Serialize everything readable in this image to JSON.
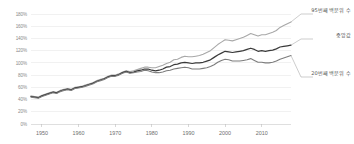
{
  "chart_data": {
    "type": "line",
    "title": "",
    "subtitle": "",
    "xlabel": "",
    "ylabel": "",
    "xlim": [
      1947,
      2018
    ],
    "ylim": [
      0,
      180
    ],
    "grid": true,
    "legend_position": "inline-right-annotations",
    "y_ticks": [
      0,
      20,
      40,
      60,
      80,
      100,
      120,
      140,
      160,
      180
    ],
    "y_tick_labels": [
      "0%",
      "20%",
      "40%",
      "60%",
      "80%",
      "100%",
      "120%",
      "140%",
      "160%",
      "180%"
    ],
    "x_ticks": [
      1950,
      1960,
      1970,
      1980,
      1990,
      2000,
      2010
    ],
    "x_tick_labels": [
      "1950",
      "1960",
      "1970",
      "1980",
      "1990",
      "2000",
      "2010"
    ],
    "x": [
      1947,
      1948,
      1949,
      1950,
      1951,
      1952,
      1953,
      1954,
      1955,
      1956,
      1957,
      1958,
      1959,
      1960,
      1961,
      1962,
      1963,
      1964,
      1965,
      1966,
      1967,
      1968,
      1969,
      1970,
      1971,
      1972,
      1973,
      1974,
      1975,
      1976,
      1977,
      1978,
      1979,
      1980,
      1981,
      1982,
      1983,
      1984,
      1985,
      1986,
      1987,
      1988,
      1989,
      1990,
      1991,
      1992,
      1993,
      1994,
      1995,
      1996,
      1997,
      1998,
      1999,
      2000,
      2001,
      2002,
      2003,
      2004,
      2005,
      2006,
      2007,
      2008,
      2009,
      2010,
      2011,
      2012,
      2013,
      2014,
      2015,
      2016,
      2017,
      2018
    ],
    "series": [
      {
        "name": "95번째 백분위 수",
        "color": "#a8a8a8",
        "width": 1.1,
        "end_label": "95번째 백분위 수",
        "values": [
          46,
          45,
          44,
          47,
          49,
          51,
          53,
          52,
          55,
          57,
          58,
          57,
          60,
          61,
          62,
          64,
          66,
          68,
          71,
          73,
          75,
          78,
          80,
          80,
          82,
          85,
          87,
          86,
          87,
          89,
          91,
          93,
          93,
          92,
          92,
          94,
          96,
          99,
          101,
          105,
          106,
          109,
          111,
          110,
          110,
          111,
          112,
          114,
          117,
          120,
          125,
          130,
          134,
          138,
          137,
          136,
          138,
          140,
          142,
          145,
          148,
          146,
          144,
          146,
          146,
          148,
          150,
          153,
          158,
          161,
          164,
          167
        ]
      },
      {
        "name": "중앙값",
        "color": "#3a3a3a",
        "width": 1.25,
        "end_label": "중앙값",
        "values": [
          45,
          44,
          43,
          46,
          48,
          50,
          52,
          51,
          54,
          56,
          57,
          56,
          59,
          60,
          61,
          63,
          65,
          67,
          70,
          72,
          74,
          77,
          79,
          79,
          81,
          84,
          86,
          84,
          85,
          87,
          88,
          90,
          90,
          88,
          87,
          88,
          90,
          93,
          94,
          97,
          98,
          100,
          101,
          100,
          99,
          100,
          100,
          101,
          103,
          105,
          109,
          113,
          116,
          119,
          118,
          117,
          118,
          119,
          120,
          122,
          124,
          122,
          119,
          120,
          119,
          120,
          121,
          123,
          126,
          127,
          128,
          129
        ]
      },
      {
        "name": "20번째 백분위 수",
        "color": "#7d7d7d",
        "width": 1.1,
        "end_label": "20번째 백분위 수",
        "values": [
          44,
          43,
          42,
          45,
          47,
          49,
          51,
          50,
          53,
          55,
          56,
          55,
          58,
          59,
          60,
          62,
          64,
          66,
          69,
          71,
          73,
          76,
          78,
          78,
          80,
          83,
          85,
          83,
          84,
          85,
          86,
          88,
          87,
          85,
          84,
          84,
          85,
          87,
          88,
          90,
          91,
          92,
          93,
          92,
          90,
          90,
          90,
          91,
          92,
          94,
          97,
          101,
          104,
          106,
          105,
          103,
          103,
          103,
          104,
          105,
          107,
          104,
          101,
          101,
          100,
          100,
          101,
          103,
          106,
          108,
          110,
          112
        ]
      }
    ]
  }
}
